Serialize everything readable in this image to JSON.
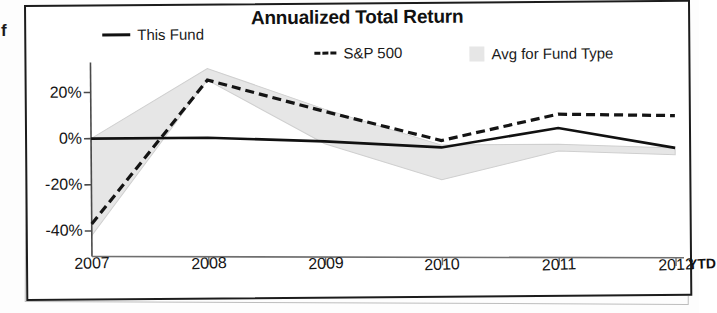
{
  "page": {
    "edge_fragment_text": "f"
  },
  "chart": {
    "title": "Annualized Total Return",
    "x_axis_suffix_label": "YTD",
    "legend": [
      {
        "label": "This Fund",
        "marker": "solid-line-swatch",
        "color": "#111111"
      },
      {
        "label": "S&P 500",
        "marker": "dashed-line-swatch",
        "color": "#141414"
      },
      {
        "label": "Avg for Fund Type",
        "marker": "filled-band-swatch",
        "color": "#e6e6e6"
      }
    ]
  },
  "chart_data": {
    "type": "line",
    "title": "Annualized Total Return",
    "xlabel": "",
    "ylabel": "",
    "x": [
      "2007",
      "2008",
      "2009",
      "2010",
      "2011",
      "2012"
    ],
    "tick_labels_x": [
      "2007",
      "2008",
      "2009",
      "2010",
      "2011",
      "2012"
    ],
    "tick_labels_y": [
      "20%",
      "0%",
      "-20%",
      "-40%"
    ],
    "ticks_y": [
      20,
      0,
      -20,
      -40
    ],
    "ylim": [
      -45,
      33
    ],
    "grid": false,
    "legend_position": "top",
    "series": [
      {
        "name": "This Fund",
        "style": "solid",
        "color": "#111111",
        "values": [
          0,
          0,
          -2,
          -5,
          3,
          -6
        ]
      },
      {
        "name": "S&P 500",
        "style": "dashed",
        "color": "#141414",
        "values": [
          -37,
          25,
          11,
          -2,
          9,
          8
        ]
      },
      {
        "name": "Avg for Fund Type",
        "style": "band",
        "color": "#e6e6e6",
        "band_upper": [
          0,
          30,
          12,
          -4,
          -4,
          -6
        ],
        "band_lower": [
          -42,
          25,
          -3,
          -19,
          -7,
          -9
        ]
      }
    ]
  }
}
